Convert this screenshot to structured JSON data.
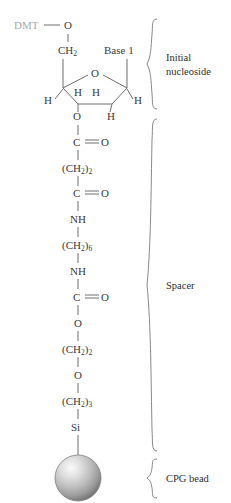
{
  "diagram": {
    "colors": {
      "bond": "#6e6e6e",
      "atom_text": "#3a3a3a",
      "dmt_text": "#a8a8a8",
      "brace": "#8a8a8a",
      "label_text": "#2e2e2e",
      "bead_light": "#f2f2f2",
      "bead_mid": "#b4b4b4",
      "bead_dark": "#6a6a6a",
      "background": "#ffffff"
    }
  },
  "nucleoside": {
    "protecting_group": "DMT",
    "linker_oxygen": "O",
    "c5_carbon": {
      "main": "CH",
      "sub": "2"
    },
    "base": "Base 1",
    "ring_oxygen": "O",
    "hydrogens": {
      "h_left": "H",
      "h_right": "H",
      "h_inner_left": "H",
      "h_inner_right": "H",
      "h_bottom_right": "H"
    },
    "c3_oxygen": "O"
  },
  "spacer_chain": [
    {
      "main": "C",
      "sub": "",
      "double_bond_o": "O"
    },
    {
      "main": "(CH",
      "sub": "2",
      "tail": ")",
      "tail_sub": "2"
    },
    {
      "main": "C",
      "sub": "",
      "double_bond_o": "O"
    },
    {
      "main": "NH",
      "sub": ""
    },
    {
      "main": "(CH",
      "sub": "2",
      "tail": ")",
      "tail_sub": "6"
    },
    {
      "main": "NH",
      "sub": ""
    },
    {
      "main": "C",
      "sub": "",
      "double_bond_o": "O"
    },
    {
      "main": "O",
      "sub": ""
    },
    {
      "main": "(CH",
      "sub": "2",
      "tail": ")",
      "tail_sub": "2"
    },
    {
      "main": "O",
      "sub": ""
    },
    {
      "main": "(CH",
      "sub": "2",
      "tail": ")",
      "tail_sub": "3"
    },
    {
      "main": "Si",
      "sub": ""
    }
  ],
  "chain_text": {
    "carbonyl": "C",
    "carbonyl_oxygen": "O",
    "ch2_open": "(CH",
    "ch2_sub": "2",
    "ch2_close_2": ")",
    "n2": "2",
    "n6": "6",
    "n3": "3",
    "nh": "NH",
    "o": "O",
    "si": "Si"
  },
  "regions": {
    "initial_nucleoside": {
      "line1": "Initial",
      "line2": "nucleoside"
    },
    "spacer": "Spacer",
    "cpg_bead": "CPG bead"
  }
}
